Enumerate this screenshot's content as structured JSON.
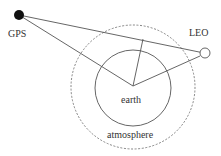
{
  "diagram": {
    "labels": {
      "gps": "GPS",
      "leo": "LEO",
      "earth": "earth",
      "atmosphere": "atmosphere"
    },
    "colors": {
      "line": "#555555",
      "dashed": "#777777",
      "gps_fill": "#111111",
      "leo_fill": "#ffffff",
      "text": "#333333"
    }
  }
}
